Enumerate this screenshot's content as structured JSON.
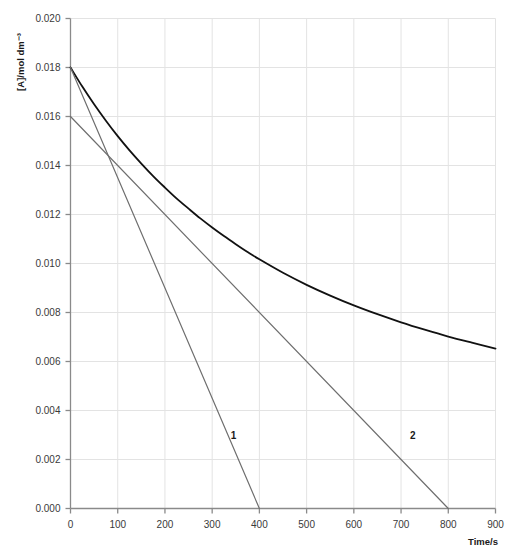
{
  "chart_data": {
    "type": "line",
    "title": "",
    "xlabel": "Time/s",
    "ylabel": "[A]/mol dm⁻³",
    "xlim": [
      0,
      900
    ],
    "ylim": [
      0,
      0.02
    ],
    "grid": true,
    "legend": "none",
    "xticks": [
      0,
      100,
      200,
      300,
      400,
      500,
      600,
      700,
      800,
      900
    ],
    "xtick_labels": [
      "0",
      "100",
      "200",
      "300",
      "400",
      "500",
      "600",
      "700",
      "800",
      "900"
    ],
    "yticks": [
      0.0,
      0.002,
      0.004,
      0.006,
      0.008,
      0.01,
      0.012,
      0.014,
      0.016,
      0.018,
      0.02
    ],
    "ytick_labels": [
      "0.000",
      "0.002",
      "0.004",
      "0.006",
      "0.008",
      "0.010",
      "0.012",
      "0.014",
      "0.016",
      "0.018",
      "0.020"
    ],
    "series": [
      {
        "name": "concentration-curve",
        "type": "line",
        "color": "#111111",
        "width": 1.8,
        "x": [
          0,
          25,
          50,
          75,
          100,
          125,
          150,
          175,
          200,
          225,
          250,
          275,
          300,
          325,
          350,
          375,
          400,
          450,
          500,
          550,
          600,
          650,
          700,
          750,
          800,
          850,
          900
        ],
        "y": [
          0.018,
          0.01722,
          0.0165,
          0.01583,
          0.0152,
          0.01462,
          0.01408,
          0.01357,
          0.0131,
          0.01265,
          0.01224,
          0.01184,
          0.01147,
          0.01112,
          0.01079,
          0.01047,
          0.01017,
          0.00962,
          0.00913,
          0.00869,
          0.00829,
          0.00793,
          0.0076,
          0.0073,
          0.00702,
          0.00677,
          0.00653
        ]
      },
      {
        "name": "tangent-line-1",
        "type": "line",
        "color": "#6e6e6e",
        "width": 1.2,
        "x": [
          0,
          400
        ],
        "y": [
          0.018,
          0.0
        ],
        "label": "1",
        "label_x": 345,
        "label_y": 0.00285
      },
      {
        "name": "tangent-line-2",
        "type": "line",
        "color": "#6e6e6e",
        "width": 1.2,
        "x": [
          0,
          800
        ],
        "y": [
          0.016,
          0.0
        ],
        "label": "2",
        "label_x": 725,
        "label_y": 0.00285
      }
    ],
    "annotations": [
      {
        "text": "1",
        "x": 345,
        "y": 0.00285
      },
      {
        "text": "2",
        "x": 725,
        "y": 0.00285
      }
    ]
  }
}
